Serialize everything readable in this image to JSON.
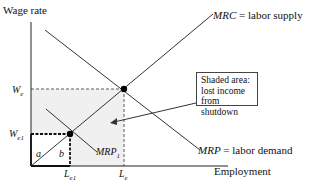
{
  "diagram": {
    "y_axis_label": "Wage rate",
    "x_axis_label": "Employment",
    "curves": {
      "supply": {
        "name": "MRC",
        "suffix": " = labor supply"
      },
      "demand": {
        "name": "MRP",
        "suffix": " = labor demand"
      },
      "demand_shifted": {
        "name": "MRP",
        "subscript": "1"
      }
    },
    "y_ticks": {
      "we": {
        "base": "W",
        "sub": "e"
      },
      "we1": {
        "base": "W",
        "sub": "e1"
      }
    },
    "x_ticks": {
      "le1": {
        "base": "L",
        "sub": "e1"
      },
      "le": {
        "base": "L",
        "sub": "e"
      }
    },
    "regions": {
      "a": "a",
      "b": "b"
    },
    "annotation": {
      "lines": [
        "Shaded area:",
        "lost income",
        "from shutdown"
      ]
    },
    "colors": {
      "shade": "#f2f2f2",
      "line": "#333333",
      "point": "#000000"
    }
  }
}
